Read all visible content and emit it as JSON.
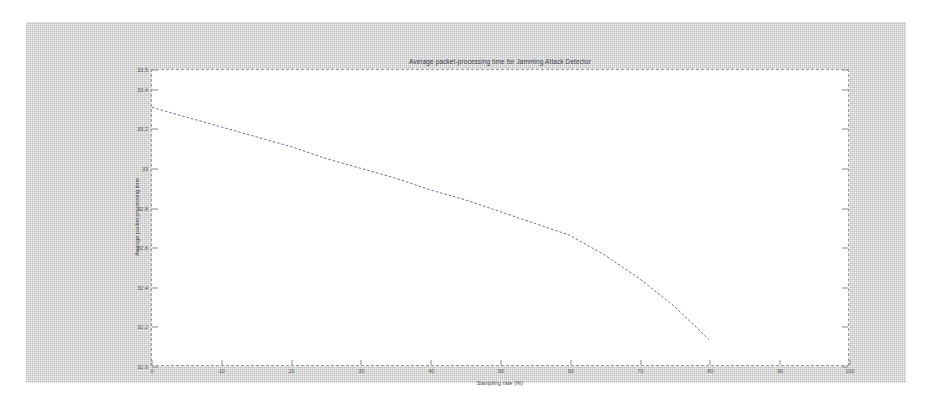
{
  "window": {
    "background_color": "#f2f2f2",
    "plot_background_color": "#ffffff",
    "axis_color": "#9a9a9a"
  },
  "chart_data": {
    "type": "line",
    "title": "Average packet-processing time for Jamming Attack Detector",
    "xlabel": "Sampling rate (%)",
    "ylabel": "Average packet processing time",
    "xlim": [
      0,
      100
    ],
    "ylim": [
      32.0,
      33.5
    ],
    "grid": false,
    "legend": null,
    "line_style": "dashed",
    "line_color": "#6b6b8a",
    "x_ticks": [
      0,
      10,
      20,
      30,
      40,
      50,
      60,
      70,
      80,
      90,
      100
    ],
    "x_tick_labels": [
      "0",
      "10",
      "20",
      "30",
      "40",
      "50",
      "60",
      "70",
      "80",
      "90",
      "100"
    ],
    "y_ticks": [
      32.0,
      32.2,
      32.4,
      32.6,
      32.8,
      33.0,
      33.2,
      33.4,
      33.5
    ],
    "y_tick_labels": [
      "32.0",
      "32.2",
      "32.4",
      "32.6",
      "32.8",
      "33",
      "33.2",
      "33.4",
      "33.5"
    ],
    "series": [
      {
        "name": "Average packet processing time",
        "x": [
          0,
          5,
          10,
          15,
          20,
          25,
          30,
          35,
          40,
          45,
          50,
          55,
          60,
          65,
          70,
          75,
          80
        ],
        "values": [
          33.31,
          33.26,
          33.21,
          33.16,
          33.11,
          33.05,
          33.0,
          32.95,
          32.89,
          32.84,
          32.78,
          32.72,
          32.66,
          32.56,
          32.44,
          32.3,
          32.13
        ]
      }
    ]
  }
}
